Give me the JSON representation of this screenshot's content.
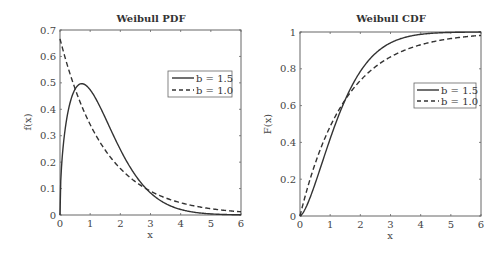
{
  "chart_data": [
    {
      "type": "line",
      "title": "Weibull PDF",
      "xlabel": "x",
      "ylabel": "f(x)",
      "xlim": [
        0,
        6
      ],
      "ylim": [
        0,
        0.7
      ],
      "xticks": [
        "0",
        "1",
        "2",
        "3",
        "4",
        "5",
        "6"
      ],
      "yticks": [
        "0",
        "0.1",
        "0.2",
        "0.3",
        "0.4",
        "0.5",
        "0.6",
        "0.7"
      ],
      "grid": false,
      "legend_position": "upper right",
      "weibull_scale_a": 1.5,
      "x": [
        0,
        0.5,
        0.72,
        1,
        1.5,
        2,
        2.5,
        3,
        3.5,
        4,
        5,
        6
      ],
      "series": [
        {
          "name": "b = 1.5",
          "style": "solid",
          "shape_b": 1.5,
          "values": [
            0,
            0.47,
            0.497,
            0.47,
            0.37,
            0.25,
            0.15,
            0.084,
            0.042,
            0.019,
            0.003,
            0.0004
          ]
        },
        {
          "name": "b = 1.0",
          "style": "dashed",
          "shape_b": 1.0,
          "values": [
            0.667,
            0.478,
            0.41,
            0.342,
            0.245,
            0.176,
            0.126,
            0.09,
            0.065,
            0.046,
            0.024,
            0.012
          ]
        }
      ]
    },
    {
      "type": "line",
      "title": "Weibull CDF",
      "xlabel": "x",
      "ylabel": "F(x)",
      "xlim": [
        0,
        6
      ],
      "ylim": [
        0,
        1
      ],
      "xticks": [
        "0",
        "1",
        "2",
        "3",
        "4",
        "5",
        "6"
      ],
      "yticks": [
        "0",
        "0.2",
        "0.4",
        "0.6",
        "0.8",
        "1"
      ],
      "grid": false,
      "legend_position": "center right",
      "weibull_scale_a": 1.5,
      "x": [
        0,
        0.5,
        1,
        1.5,
        2,
        2.5,
        3,
        3.5,
        4,
        5,
        6
      ],
      "series": [
        {
          "name": "b = 1.5",
          "style": "solid",
          "shape_b": 1.5,
          "values": [
            0,
            0.175,
            0.42,
            0.632,
            0.785,
            0.884,
            0.941,
            0.972,
            0.987,
            0.998,
            1.0
          ]
        },
        {
          "name": "b = 1.0",
          "style": "dashed",
          "shape_b": 1.0,
          "values": [
            0,
            0.283,
            0.487,
            0.632,
            0.736,
            0.811,
            0.865,
            0.903,
            0.931,
            0.964,
            0.982
          ]
        }
      ]
    }
  ],
  "plots": {
    "pdf": {
      "title": "Weibull PDF",
      "xlabel": "x",
      "ylabel": "f(x)",
      "legend": [
        "b = 1.5",
        "b = 1.0"
      ]
    },
    "cdf": {
      "title": "Weibull CDF",
      "xlabel": "x",
      "ylabel": "F(x)",
      "legend": [
        "b = 1.5",
        "b = 1.0"
      ]
    }
  }
}
